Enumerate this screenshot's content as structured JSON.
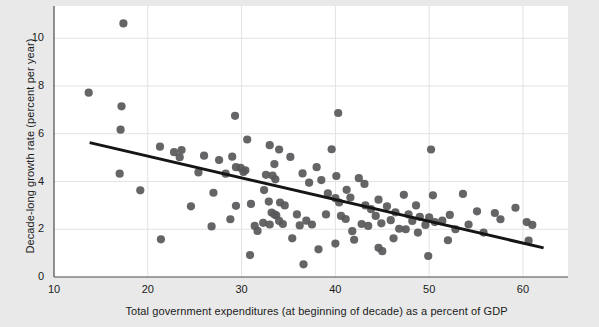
{
  "chart_data": {
    "type": "scatter",
    "title": "",
    "subtitle": "",
    "xlabel": "Total government expenditures (at beginning of decade) as a percent of GDP",
    "ylabel": "Decade-long growth rate (percent per year)",
    "xlim": [
      10,
      64.8
    ],
    "ylim": [
      0,
      11.1
    ],
    "xticks": [
      10,
      20,
      30,
      40,
      50,
      60
    ],
    "xtick_labels": [
      "10",
      "20",
      "30",
      "40",
      "50",
      "60"
    ],
    "yticks": [
      0,
      2,
      4,
      6,
      8,
      10
    ],
    "ytick_labels": [
      "0",
      "2",
      "4",
      "6",
      "8",
      "10"
    ],
    "grid": true,
    "legend": null,
    "marker_color": "#58585a",
    "line_color": "#151515",
    "plot_bg": "#ffffff",
    "figure_bg": "#e9e9e9",
    "trend_line": {
      "x": [
        13.8,
        62.2
      ],
      "y": [
        5.63,
        1.22
      ],
      "label": "fitted regression line"
    },
    "points": [
      [
        17.4,
        10.62
      ],
      [
        13.7,
        7.72
      ],
      [
        17.2,
        7.15
      ],
      [
        17.1,
        6.17
      ],
      [
        17.0,
        4.33
      ],
      [
        19.2,
        3.63
      ],
      [
        21.3,
        5.46
      ],
      [
        22.8,
        5.23
      ],
      [
        23.4,
        5.02
      ],
      [
        23.6,
        5.32
      ],
      [
        21.4,
        1.58
      ],
      [
        26.0,
        5.08
      ],
      [
        27.6,
        4.9
      ],
      [
        29.0,
        5.04
      ],
      [
        29.3,
        6.75
      ],
      [
        30.6,
        5.76
      ],
      [
        29.4,
        4.6
      ],
      [
        28.3,
        4.33
      ],
      [
        29.9,
        4.57
      ],
      [
        30.2,
        4.4
      ],
      [
        30.4,
        4.47
      ],
      [
        27.0,
        3.53
      ],
      [
        29.4,
        2.98
      ],
      [
        31.0,
        3.06
      ],
      [
        30.9,
        0.92
      ],
      [
        33.0,
        5.52
      ],
      [
        34.0,
        5.34
      ],
      [
        33.5,
        4.73
      ],
      [
        35.2,
        5.03
      ],
      [
        32.6,
        4.28
      ],
      [
        33.3,
        4.25
      ],
      [
        33.6,
        4.09
      ],
      [
        32.4,
        3.64
      ],
      [
        32.9,
        3.16
      ],
      [
        33.2,
        2.7
      ],
      [
        33.5,
        2.62
      ],
      [
        33.7,
        2.58
      ],
      [
        34.1,
        3.12
      ],
      [
        34.6,
        3.0
      ],
      [
        34.0,
        2.35
      ],
      [
        32.3,
        2.27
      ],
      [
        33.0,
        2.2
      ],
      [
        34.4,
        2.22
      ],
      [
        31.7,
        1.93
      ],
      [
        36.6,
        0.53
      ],
      [
        36.2,
        2.16
      ],
      [
        36.5,
        4.34
      ],
      [
        37.2,
        3.95
      ],
      [
        38.0,
        4.6
      ],
      [
        38.5,
        4.06
      ],
      [
        39.6,
        5.35
      ],
      [
        40.3,
        6.87
      ],
      [
        40.1,
        4.23
      ],
      [
        39.2,
        3.5
      ],
      [
        40.0,
        3.3
      ],
      [
        40.4,
        3.12
      ],
      [
        41.2,
        3.65
      ],
      [
        41.6,
        3.33
      ],
      [
        40.6,
        2.56
      ],
      [
        41.1,
        2.43
      ],
      [
        40.0,
        1.4
      ],
      [
        41.8,
        1.92
      ],
      [
        42.5,
        4.14
      ],
      [
        43.1,
        3.9
      ],
      [
        43.2,
        3.0
      ],
      [
        43.8,
        2.84
      ],
      [
        42.8,
        2.22
      ],
      [
        43.5,
        2.14
      ],
      [
        44.6,
        3.24
      ],
      [
        44.3,
        2.56
      ],
      [
        44.9,
        2.25
      ],
      [
        44.6,
        1.22
      ],
      [
        45.5,
        2.96
      ],
      [
        45.9,
        2.38
      ],
      [
        46.4,
        2.71
      ],
      [
        46.2,
        1.62
      ],
      [
        47.3,
        3.44
      ],
      [
        47.8,
        2.62
      ],
      [
        47.5,
        2.0
      ],
      [
        48.6,
        3.0
      ],
      [
        48.2,
        2.35
      ],
      [
        49.0,
        2.52
      ],
      [
        48.8,
        1.86
      ],
      [
        49.6,
        2.18
      ],
      [
        50.2,
        5.34
      ],
      [
        50.4,
        3.42
      ],
      [
        50.0,
        2.5
      ],
      [
        50.6,
        2.3
      ],
      [
        49.9,
        0.88
      ],
      [
        51.4,
        2.36
      ],
      [
        52.2,
        2.6
      ],
      [
        52.8,
        2.0
      ],
      [
        53.6,
        3.48
      ],
      [
        54.2,
        2.2
      ],
      [
        55.1,
        2.75
      ],
      [
        55.8,
        1.86
      ],
      [
        57.0,
        2.68
      ],
      [
        57.6,
        2.42
      ],
      [
        59.2,
        2.9
      ],
      [
        60.4,
        2.3
      ],
      [
        61.0,
        2.18
      ],
      [
        60.6,
        1.52
      ],
      [
        25.4,
        4.38
      ],
      [
        24.6,
        2.96
      ],
      [
        26.8,
        2.12
      ],
      [
        36.9,
        2.36
      ],
      [
        37.5,
        2.2
      ],
      [
        35.4,
        1.62
      ],
      [
        38.2,
        1.16
      ],
      [
        45.0,
        1.08
      ],
      [
        39.0,
        2.62
      ],
      [
        42.0,
        1.56
      ],
      [
        46.8,
        2.02
      ],
      [
        31.4,
        2.14
      ],
      [
        35.9,
        2.62
      ],
      [
        28.8,
        2.42
      ],
      [
        52.0,
        1.54
      ]
    ]
  }
}
